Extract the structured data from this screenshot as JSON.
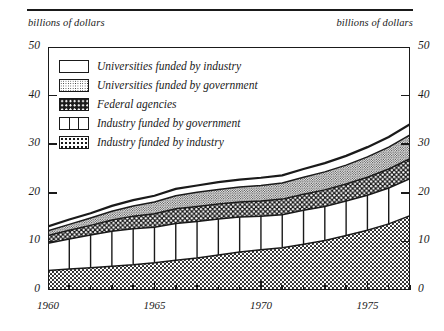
{
  "header": {
    "rule": true
  },
  "axis_captions": {
    "left": "billions of dollars",
    "right": "billions of dollars"
  },
  "legend": {
    "items": [
      {
        "label": "Universities funded by industry",
        "swatch": "white-plain",
        "key": "univ_industry"
      },
      {
        "label": "Universities funded by government",
        "swatch": "fine-stipple",
        "key": "univ_government"
      },
      {
        "label": "Federal agencies",
        "swatch": "black-dotted",
        "key": "federal_agencies"
      },
      {
        "label": "Industry funded by government",
        "swatch": "vertical-bars",
        "key": "industry_government"
      },
      {
        "label": "Industry funded by industry",
        "swatch": "coarse-stipple",
        "key": "industry_industry"
      }
    ]
  },
  "chart_data": {
    "type": "area",
    "title": "",
    "subtitle": "",
    "xlabel": "",
    "ylabel": "billions of dollars",
    "y2label": "billions of dollars",
    "stacked": true,
    "grid": false,
    "legend_position": "upper-left-inside",
    "xlim": [
      1960,
      1977
    ],
    "ylim": [
      0,
      50
    ],
    "yticks": [
      0,
      10,
      20,
      30,
      40,
      50
    ],
    "ytick_labels": [
      "0",
      "10",
      "20",
      "30",
      "40",
      "50"
    ],
    "xticks": [
      1960,
      1961,
      1962,
      1963,
      1964,
      1965,
      1966,
      1967,
      1968,
      1969,
      1970,
      1971,
      1972,
      1973,
      1974,
      1975,
      1976,
      1977
    ],
    "xtick_labels_major": [
      "1960",
      "1965",
      "1970",
      "1975"
    ],
    "xticks_major": [
      1960,
      1965,
      1970,
      1975
    ],
    "x": [
      1960,
      1961,
      1962,
      1963,
      1964,
      1965,
      1966,
      1967,
      1968,
      1969,
      1970,
      1971,
      1972,
      1973,
      1974,
      1975,
      1976,
      1977
    ],
    "series": [
      {
        "name": "Industry funded by industry",
        "pattern": "coarse-stipple",
        "values": [
          4.0,
          4.3,
          4.6,
          4.9,
          5.2,
          5.6,
          6.1,
          6.6,
          7.2,
          7.8,
          8.3,
          8.7,
          9.4,
          10.2,
          11.2,
          12.3,
          13.6,
          15.3
        ]
      },
      {
        "name": "Industry funded by government",
        "pattern": "vertical-bars",
        "values": [
          5.6,
          6.2,
          6.7,
          7.2,
          7.4,
          7.3,
          7.6,
          7.5,
          7.4,
          7.2,
          6.9,
          6.8,
          7.0,
          7.0,
          7.1,
          7.2,
          7.4,
          7.6
        ]
      },
      {
        "name": "Federal agencies",
        "pattern": "black-dotted",
        "values": [
          1.6,
          1.8,
          2.0,
          2.3,
          2.6,
          2.8,
          3.0,
          3.1,
          3.1,
          3.1,
          3.1,
          3.2,
          3.3,
          3.4,
          3.5,
          3.7,
          3.9,
          4.1
        ]
      },
      {
        "name": "Universities funded by government",
        "pattern": "fine-stipple",
        "values": [
          1.0,
          1.2,
          1.5,
          1.8,
          2.1,
          2.4,
          2.7,
          2.9,
          3.0,
          3.1,
          3.2,
          3.3,
          3.5,
          3.7,
          3.9,
          4.2,
          4.5,
          4.9
        ]
      },
      {
        "name": "Universities funded by industry",
        "pattern": "white-plain",
        "values": [
          0.9,
          1.0,
          1.0,
          1.1,
          1.2,
          1.3,
          1.4,
          1.4,
          1.5,
          1.5,
          1.6,
          1.6,
          1.7,
          1.8,
          1.9,
          2.0,
          2.1,
          2.2
        ]
      }
    ],
    "totals": [
      13.1,
      14.5,
      15.8,
      17.3,
      18.5,
      19.4,
      20.8,
      21.5,
      22.2,
      22.7,
      23.1,
      23.6,
      24.9,
      26.1,
      27.6,
      29.4,
      31.5,
      34.1
    ]
  }
}
